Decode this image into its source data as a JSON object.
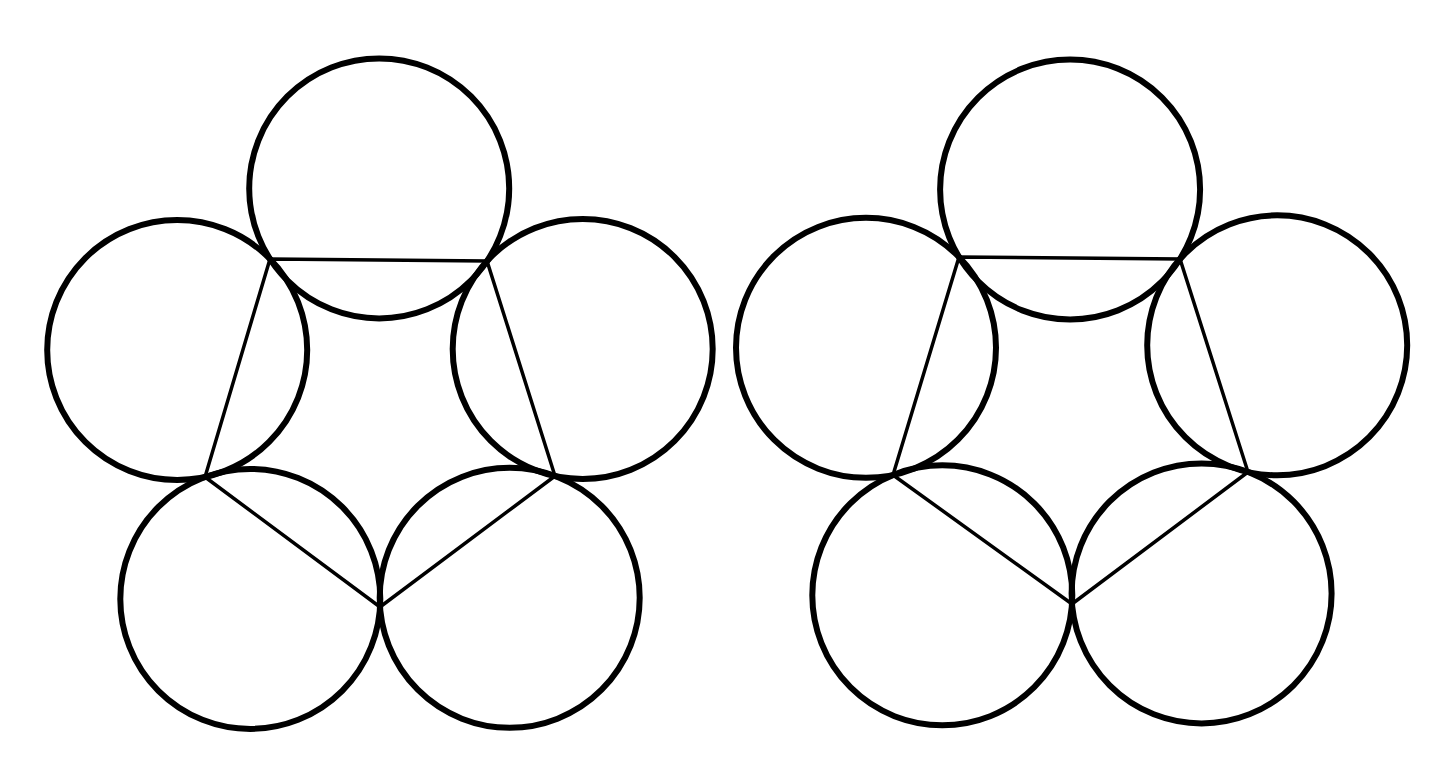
{
  "canvas": {
    "width": 1449,
    "height": 773,
    "background": "#ffffff"
  },
  "style": {
    "circle_stroke": "#000000",
    "circle_stroke_width": 6,
    "pentagon_stroke": "#000000",
    "pentagon_stroke_width": 3.5
  },
  "figures": [
    {
      "name": "left-flower",
      "vertices": [
        [
          270,
          259
        ],
        [
          487,
          261
        ],
        [
          555,
          476
        ],
        [
          380,
          607
        ],
        [
          205,
          477
        ]
      ],
      "radius": 130
    },
    {
      "name": "right-flower",
      "vertices": [
        [
          959,
          257
        ],
        [
          1180,
          259
        ],
        [
          1248,
          472
        ],
        [
          1072,
          604
        ],
        [
          893,
          475
        ]
      ],
      "radius": 130
    }
  ]
}
